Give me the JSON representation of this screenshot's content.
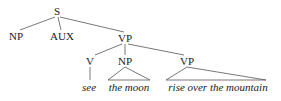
{
  "diagram": {
    "type": "syntax-tree",
    "nodes": {
      "s": "S",
      "np1": "NP",
      "aux": "AUX",
      "vp1": "VP",
      "v": "V",
      "np2": "NP",
      "vp2": "VP"
    },
    "leaves": {
      "see": "see",
      "the_moon": "the moon",
      "rise": "rise over the mountain"
    },
    "colors": {
      "text": "#1a1a1a",
      "lines": "#555555",
      "background": "#ffffff"
    }
  }
}
